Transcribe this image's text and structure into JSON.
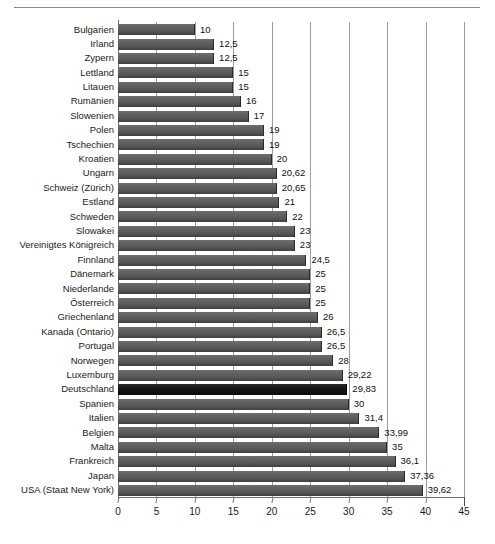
{
  "chart_data": {
    "type": "bar",
    "orientation": "horizontal",
    "title": "",
    "subtitle": "",
    "xlabel": "",
    "ylabel": "",
    "xlim": [
      0,
      45
    ],
    "xticks": [
      0,
      5,
      10,
      15,
      20,
      25,
      30,
      35,
      40,
      45
    ],
    "xtick_labels": [
      "0",
      "5",
      "10",
      "15",
      "20",
      "25",
      "30",
      "35",
      "40",
      "45"
    ],
    "grid": "vertical",
    "legend": "none",
    "decimal_separator": ",",
    "highlight_category": "Deutschland",
    "bar_color": "#585858",
    "highlight_color": "#111111",
    "categories": [
      "Bulgarien",
      "Irland",
      "Zypern",
      "Lettland",
      "Litauen",
      "Rumänien",
      "Slowenien",
      "Polen",
      "Tschechien",
      "Kroatien",
      "Ungarn",
      "Schweiz (Zürich)",
      "Estland",
      "Schweden",
      "Slowakei",
      "Vereinigtes Königreich",
      "Finnland",
      "Dänemark",
      "Niederlande",
      "Österreich",
      "Griechenland",
      "Kanada (Ontario)",
      "Portugal",
      "Norwegen",
      "Luxemburg",
      "Deutschland",
      "Spanien",
      "Italien",
      "Belgien",
      "Malta",
      "Frankreich",
      "Japan",
      "USA (Staat New York)"
    ],
    "values": [
      10,
      12.5,
      12.5,
      15,
      15,
      16,
      17,
      19,
      19,
      20,
      20.62,
      20.65,
      21,
      22,
      23,
      23,
      24.5,
      25,
      25,
      25,
      26,
      26.5,
      26.5,
      28,
      29.22,
      29.83,
      30,
      31.4,
      33.99,
      35,
      36.1,
      37.36,
      39.62
    ],
    "value_labels": [
      "10",
      "12,5",
      "12,5",
      "15",
      "15",
      "16",
      "17",
      "19",
      "19",
      "20",
      "20,62",
      "20,65",
      "21",
      "22",
      "23",
      "23",
      "24,5",
      "25",
      "25",
      "25",
      "26",
      "26,5",
      "26,5",
      "28",
      "29,22",
      "29,83",
      "30",
      "31,4",
      "33,99",
      "35",
      "36,1",
      "37,36",
      "39,62"
    ]
  }
}
